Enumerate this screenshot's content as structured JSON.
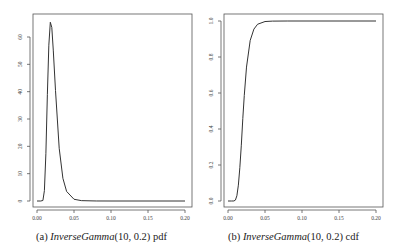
{
  "chart_data": [
    {
      "type": "line",
      "title": "",
      "caption_label": "(a)",
      "caption_math": "InverseGamma",
      "caption_args": "(10, 0.2)",
      "caption_suffix": "pdf",
      "xlabel": "",
      "ylabel": "",
      "xlim": [
        0,
        0.2
      ],
      "ylim": [
        0,
        66
      ],
      "grid": false,
      "xticks": [
        0.0,
        0.05,
        0.1,
        0.15,
        0.2
      ],
      "xtick_labels": [
        "0.00",
        "0.05",
        "0.10",
        "0.15",
        "0.20"
      ],
      "yticks": [
        0,
        10,
        20,
        30,
        40,
        50,
        60
      ],
      "ytick_labels": [
        "0",
        "10",
        "20",
        "30",
        "40",
        "50",
        "60"
      ],
      "series": [
        {
          "name": "pdf",
          "x": [
            0.0,
            0.005,
            0.008,
            0.01,
            0.012,
            0.014,
            0.016,
            0.018,
            0.02,
            0.022,
            0.025,
            0.03,
            0.035,
            0.04,
            0.05,
            0.06,
            0.08,
            0.1,
            0.15,
            0.2
          ],
          "y": [
            0.0,
            0.0,
            0.19,
            3.8,
            17.3,
            38.9,
            57.0,
            65.4,
            63.5,
            55.2,
            40.4,
            19.3,
            8.3,
            3.5,
            0.64,
            0.13,
            0.008,
            0.0005,
            0.0,
            0.0
          ]
        }
      ]
    },
    {
      "type": "line",
      "title": "",
      "caption_label": "(b)",
      "caption_math": "InverseGamma",
      "caption_args": "(10, 0.2)",
      "caption_suffix": "cdf",
      "xlabel": "",
      "ylabel": "",
      "xlim": [
        0,
        0.2
      ],
      "ylim": [
        0,
        1.0
      ],
      "grid": false,
      "xticks": [
        0.0,
        0.05,
        0.1,
        0.15,
        0.2
      ],
      "xtick_labels": [
        "0.00",
        "0.05",
        "0.10",
        "0.15",
        "0.20"
      ],
      "yticks": [
        0.0,
        0.2,
        0.4,
        0.6,
        0.8,
        1.0
      ],
      "ytick_labels": [
        "0.0",
        "0.2",
        "0.4",
        "0.6",
        "0.8",
        "1.0"
      ],
      "series": [
        {
          "name": "cdf",
          "x": [
            0.0,
            0.005,
            0.008,
            0.01,
            0.012,
            0.014,
            0.016,
            0.018,
            0.02,
            0.022,
            0.025,
            0.03,
            0.035,
            0.04,
            0.05,
            0.06,
            0.08,
            0.1,
            0.15,
            0.2
          ],
          "y": [
            0.0,
            0.0,
            0.0002,
            0.005,
            0.029,
            0.088,
            0.185,
            0.31,
            0.458,
            0.586,
            0.744,
            0.892,
            0.955,
            0.982,
            0.997,
            0.9994,
            1.0,
            1.0,
            1.0,
            1.0
          ]
        }
      ]
    }
  ],
  "captions": {
    "a": {
      "label": "(a)",
      "math": "InverseGamma",
      "args": "(10, 0.2)",
      "suffix": "pdf"
    },
    "b": {
      "label": "(b)",
      "math": "InverseGamma",
      "args": "(10, 0.2)",
      "suffix": "cdf"
    }
  }
}
